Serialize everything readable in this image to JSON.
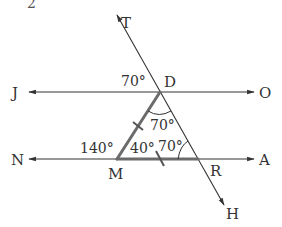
{
  "problem_number": "2",
  "colors": {
    "line": "#333333",
    "triangle": "#6b6b6b",
    "text": "#333333",
    "background": "#ffffff"
  },
  "points": {
    "T": {
      "label": "T",
      "x": 117,
      "y": 15
    },
    "D": {
      "label": "D",
      "x": 160,
      "y": 92
    },
    "M": {
      "label": "M",
      "x": 117,
      "y": 159
    },
    "R": {
      "label": "R",
      "x": 198,
      "y": 159
    },
    "H": {
      "label": "H",
      "x": 224,
      "y": 205
    },
    "J": {
      "label": "J"
    },
    "O": {
      "label": "O"
    },
    "N": {
      "label": "N"
    },
    "A": {
      "label": "A"
    }
  },
  "lines": {
    "JO": {
      "description": "line through J, D, O with arrows at both ends",
      "y": 92
    },
    "NA": {
      "description": "line through N, M, R, A with arrows at both ends",
      "y": 159
    },
    "TH": {
      "description": "transversal through T, D, R, H with arrows at both ends"
    }
  },
  "angles": {
    "JDT": "70°",
    "MDR": "70°",
    "NMD": "140°",
    "DMR": "40°",
    "DRM": "70°"
  },
  "triangle": {
    "vertices": [
      "D",
      "M",
      "R"
    ],
    "equal_sides_marked": [
      "DM",
      "MR"
    ]
  }
}
